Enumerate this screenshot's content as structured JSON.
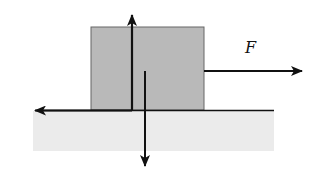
{
  "diagram": {
    "labels": {
      "applied_force": "F"
    },
    "colors": {
      "block_fill": "#b9b9b9",
      "block_stroke": "#666666",
      "ground_fill": "#ebebeb",
      "line": "#111111"
    },
    "elements": {
      "block": "rectangular block resting on surface",
      "ground": "horizontal surface with shaded region",
      "arrows": [
        {
          "name": "applied-force",
          "direction": "right",
          "label": "F"
        },
        {
          "name": "normal-force",
          "direction": "up"
        },
        {
          "name": "weight",
          "direction": "down"
        },
        {
          "name": "friction",
          "direction": "left"
        }
      ]
    }
  }
}
